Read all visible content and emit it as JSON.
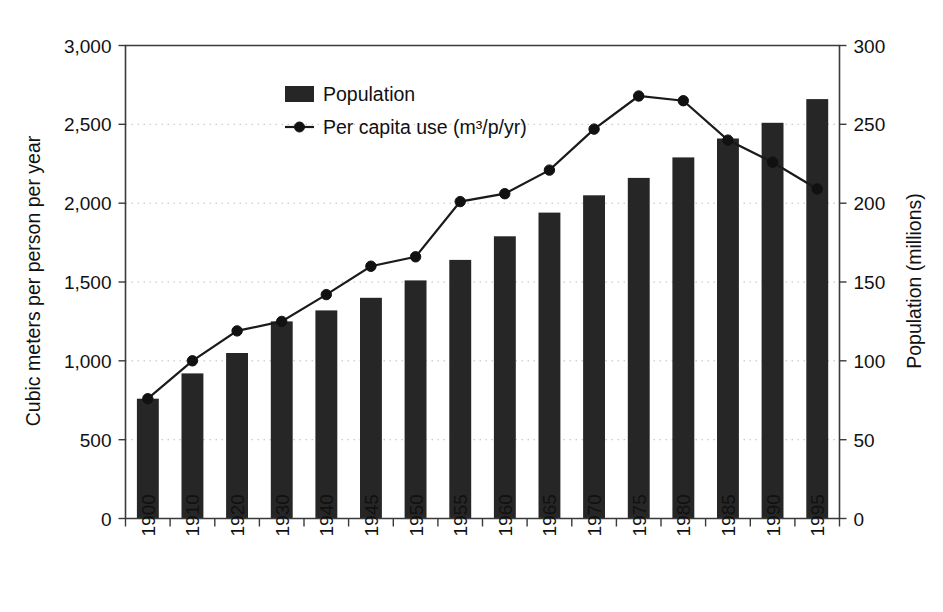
{
  "chart_data": {
    "type": "bar",
    "title": "",
    "subtitle": "",
    "categories": [
      "1900",
      "1910",
      "1920",
      "1930",
      "1940",
      "1945",
      "1950",
      "1955",
      "1960",
      "1965",
      "1970",
      "1975",
      "1980",
      "1985",
      "1990",
      "1995"
    ],
    "series": [
      {
        "name": "Population",
        "kind": "bar",
        "axis": "right",
        "unit": "millions",
        "values": [
          76,
          92,
          105,
          125,
          132,
          140,
          151,
          164,
          179,
          194,
          205,
          216,
          229,
          241,
          251,
          266
        ]
      },
      {
        "name": "Per capita use (m³/p/yr)",
        "kind": "line",
        "axis": "left",
        "unit": "cubic meters per person per year",
        "values": [
          760,
          1000,
          1190,
          1250,
          1420,
          1600,
          1660,
          2010,
          2060,
          2210,
          2470,
          2680,
          2650,
          2400,
          2260,
          2090
        ]
      }
    ],
    "xlabel": "",
    "ylabel": "Cubic meters per person per year",
    "y2label": "Population (millions)",
    "ylim": [
      0,
      3000
    ],
    "y2lim": [
      0,
      300
    ],
    "yticks": [
      "0",
      "500",
      "1,000",
      "1,500",
      "2,000",
      "2,500",
      "3,000"
    ],
    "ytick_values": [
      0,
      500,
      1000,
      1500,
      2000,
      2500,
      3000
    ],
    "y2ticks": [
      "0",
      "50",
      "100",
      "150",
      "200",
      "250",
      "300"
    ],
    "y2tick_values": [
      0,
      50,
      100,
      150,
      200,
      250,
      300
    ],
    "grid": true,
    "grid_axis": "y",
    "legend_position": "top-center",
    "legend": [
      {
        "label": "Population",
        "marker": "filled-rect",
        "color": "#262626"
      },
      {
        "label": "Per capita use (m³/p/yr)",
        "marker": "line-with-dot",
        "color": "#1a1a1a"
      }
    ]
  },
  "colors": {
    "bar": "#262626",
    "line": "#1a1a1a",
    "axis": "#3a3a3a",
    "grid": "#bdbdbd",
    "background": "#ffffff",
    "text": "#111111"
  }
}
